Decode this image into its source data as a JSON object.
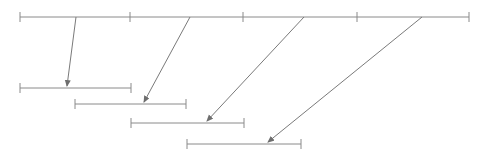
{
  "diagram": {
    "type": "sliding-window-mapping",
    "stroke_color": "#8a8a8a",
    "arrow_color": "#7a7a7a",
    "top_line": {
      "y": 17,
      "x_start": 20,
      "x_end": 469,
      "ticks": [
        20,
        130,
        243,
        357,
        469
      ]
    },
    "segments": [
      {
        "y": 88,
        "x_start": 20,
        "x_end": 131
      },
      {
        "y": 104,
        "x_start": 75,
        "x_end": 186
      },
      {
        "y": 123,
        "x_start": 131,
        "x_end": 244
      },
      {
        "y": 144,
        "x_start": 187,
        "x_end": 301
      }
    ],
    "arrows": [
      {
        "x1": 76,
        "y1": 17,
        "x2": 67,
        "y2": 86
      },
      {
        "x1": 190,
        "y1": 17,
        "x2": 144,
        "y2": 102
      },
      {
        "x1": 304,
        "y1": 17,
        "x2": 207,
        "y2": 121
      },
      {
        "x1": 422,
        "y1": 17,
        "x2": 268,
        "y2": 142
      }
    ]
  }
}
